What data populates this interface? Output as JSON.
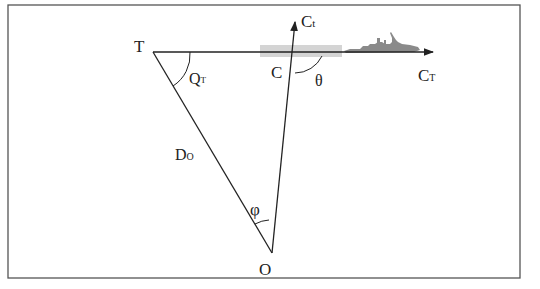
{
  "figure": {
    "type": "geometric-diagram",
    "points": {
      "T": {
        "label": "T"
      },
      "C": {
        "label": "C"
      },
      "O": {
        "label": "O"
      }
    },
    "vectors": {
      "target_course": {
        "label": "C",
        "subscript": "T"
      },
      "own_course": {
        "label": "C",
        "subscript": "t"
      }
    },
    "segments": {
      "distance": {
        "label": "D",
        "subscript": "O"
      }
    },
    "angles": {
      "q_t": {
        "label": "Q",
        "subscript": "T"
      },
      "theta": {
        "label": "θ"
      },
      "phi": {
        "label": "φ"
      }
    },
    "ship_icon": "warship-silhouette-icon",
    "colors": {
      "line": "#222222",
      "frame": "#555555",
      "band": "#d4d4d4",
      "ship": "#8a8a8a"
    }
  }
}
